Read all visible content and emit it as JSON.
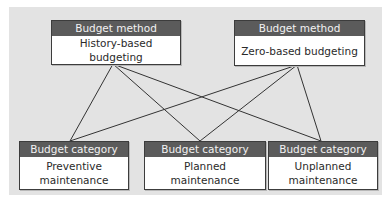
{
  "diagram": {
    "methods": [
      {
        "header": "Budget method",
        "label": "History-based budgeting"
      },
      {
        "header": "Budget method",
        "label": "Zero-based budgeting"
      }
    ],
    "categories": [
      {
        "header": "Budget category",
        "label": "Preventive\nmaintenance"
      },
      {
        "header": "Budget category",
        "label": "Planned\nmaintenance"
      },
      {
        "header": "Budget category",
        "label": "Unplanned\nmaintenance"
      }
    ],
    "connections": [
      [
        "History-based budgeting",
        "Preventive maintenance"
      ],
      [
        "History-based budgeting",
        "Planned maintenance"
      ],
      [
        "History-based budgeting",
        "Unplanned maintenance"
      ],
      [
        "Zero-based budgeting",
        "Preventive maintenance"
      ],
      [
        "Zero-based budgeting",
        "Planned maintenance"
      ],
      [
        "Zero-based budgeting",
        "Unplanned maintenance"
      ]
    ],
    "colors": {
      "panel": "#e3e3e3",
      "header": "#5b5b5b",
      "border": "#3c3c3c"
    }
  }
}
